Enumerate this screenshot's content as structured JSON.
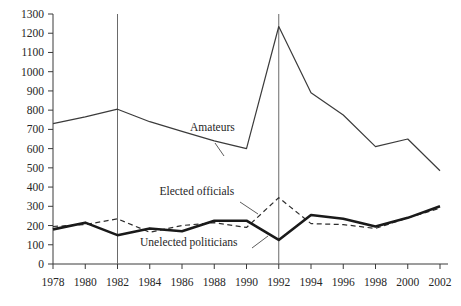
{
  "chart_data": {
    "type": "line",
    "title": "",
    "xlabel": "",
    "ylabel": "",
    "xlim": [
      1978,
      2002
    ],
    "ylim": [
      0,
      1300
    ],
    "grid": false,
    "legend_position": "inline-annotations",
    "x": [
      1978,
      1980,
      1982,
      1984,
      1986,
      1988,
      1990,
      1992,
      1994,
      1996,
      1998,
      2000,
      2002
    ],
    "x_tick_labels": [
      "1978",
      "1980",
      "1982",
      "1984",
      "1986",
      "1988",
      "1990",
      "1992",
      "1994",
      "1996",
      "1998",
      "2000",
      "2002"
    ],
    "y_tick_labels": [
      "0",
      "100",
      "200",
      "300",
      "400",
      "500",
      "600",
      "700",
      "800",
      "900",
      "1000",
      "1100",
      "1200",
      "1300"
    ],
    "y_ticks": [
      0,
      100,
      200,
      300,
      400,
      500,
      600,
      700,
      800,
      900,
      1000,
      1100,
      1200,
      1300
    ],
    "annotations": [
      {
        "text": "Amateurs",
        "x": 1986.5,
        "y": 690
      },
      {
        "text": "Elected officials",
        "x": 1984.6,
        "y": 360
      },
      {
        "text": "Unelected politicians",
        "x": 1983.4,
        "y": 95
      }
    ],
    "vertical_rules": [
      1982,
      1992
    ],
    "series": [
      {
        "name": "Amateurs",
        "style": "thin-solid",
        "color": "#3b3b3b",
        "values": [
          730,
          765,
          805,
          740,
          690,
          640,
          600,
          1235,
          890,
          775,
          610,
          650,
          485
        ]
      },
      {
        "name": "Elected officials",
        "style": "dashed",
        "color": "#2e2e2e",
        "values": [
          195,
          205,
          235,
          165,
          200,
          215,
          190,
          345,
          210,
          205,
          185,
          240,
          290
        ]
      },
      {
        "name": "Unelected politicians",
        "style": "thick-solid",
        "color": "#1a1a1a",
        "values": [
          180,
          215,
          150,
          185,
          170,
          225,
          225,
          125,
          255,
          235,
          195,
          240,
          300
        ]
      }
    ]
  }
}
